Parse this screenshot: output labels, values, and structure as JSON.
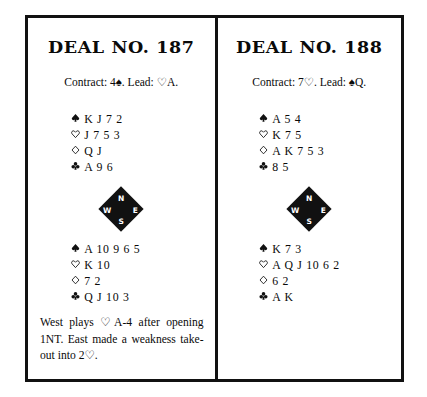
{
  "page": {
    "background": "#ffffff",
    "ink": "#111111"
  },
  "suits": {
    "spade": "♠",
    "heart": "♡",
    "diamond": "♢",
    "club": "♣"
  },
  "compass": {
    "north": "N",
    "west": "W",
    "east": "E",
    "south": "S"
  },
  "deals": [
    {
      "title": "DEAL NO. 187",
      "contract_line": "Contract: 4♠. Lead: ♡A.",
      "north": {
        "spades": "K J 7 2",
        "hearts": "J 7 5 3",
        "diamonds": "Q J",
        "clubs": "A 9 6"
      },
      "south": {
        "spades": "A 10 9 6 5",
        "hearts": "K 10",
        "diamonds": "7 2",
        "clubs": "Q J 10 3"
      },
      "footnote": "West plays ♡A-4 after opening 1NT. East made a weakness take-out into 2♡."
    },
    {
      "title": "DEAL NO. 188",
      "contract_line": "Contract: 7♡. Lead: ♠Q.",
      "north": {
        "spades": "A 5 4",
        "hearts": "K 7 5",
        "diamonds": "A K 7 5 3",
        "clubs": "8 5"
      },
      "south": {
        "spades": "K 7 3",
        "hearts": "A Q J 10 6 2",
        "diamonds": "6 2",
        "clubs": "A K"
      },
      "footnote": ""
    }
  ]
}
